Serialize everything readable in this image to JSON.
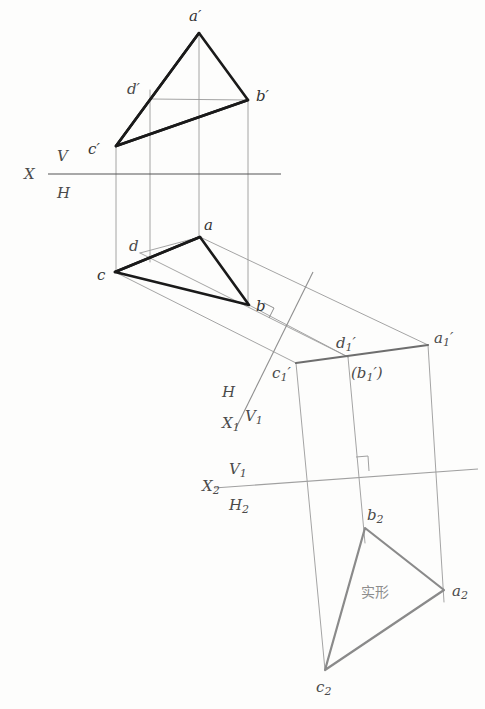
{
  "figure": {
    "background_color": "#fdfdfc",
    "heavy_line_color": "#1a1a1a",
    "light_line_color": "#9a9a9a",
    "true_shape_line_color": "#8a8a8a",
    "label_color": "#4a4a4a"
  },
  "axes": {
    "x_main": {
      "name": "X",
      "upper_label": "V",
      "lower_label": "H",
      "x1": 48,
      "y1": 174,
      "x2": 281,
      "y2": 174
    },
    "x1_aux": {
      "name": "X",
      "subscript": "1",
      "upper_label": "H",
      "lower_label": "V",
      "lower_subscript": "1",
      "x1": 313,
      "y1": 272,
      "x2": 236,
      "y2": 428
    },
    "x2_aux": {
      "name": "X",
      "subscript": "2",
      "upper_label": "V",
      "upper_subscript": "1",
      "lower_label": "H",
      "lower_subscript": "2",
      "x1": 214,
      "y1": 488,
      "x2": 478,
      "y2": 469
    }
  },
  "views": {
    "frontal_v": {
      "name": "V projection (front view)",
      "points": [
        {
          "id": "a_prime",
          "label": "a",
          "prime": "′",
          "x": 199,
          "y": 33,
          "lx": 196,
          "ly": 16
        },
        {
          "id": "b_prime",
          "label": "b",
          "prime": "′",
          "x": 248,
          "y": 100,
          "lx": 258,
          "ly": 97
        },
        {
          "id": "c_prime",
          "label": "c",
          "prime": "′",
          "x": 116,
          "y": 146,
          "lx": 95,
          "ly": 150
        },
        {
          "id": "d_prime",
          "label": "d",
          "prime": "′",
          "x": 150,
          "y": 99,
          "lx": 133,
          "ly": 90
        }
      ]
    },
    "horizontal_h": {
      "name": "H projection (top view)",
      "points": [
        {
          "id": "a",
          "label": "a",
          "prime": "",
          "x": 200,
          "y": 237,
          "lx": 205,
          "ly": 226
        },
        {
          "id": "b",
          "label": "b",
          "prime": "",
          "x": 249,
          "y": 305,
          "lx": 257,
          "ly": 304
        },
        {
          "id": "c",
          "label": "c",
          "prime": "",
          "x": 115,
          "y": 272,
          "lx": 101,
          "ly": 275
        },
        {
          "id": "d",
          "label": "d",
          "prime": "",
          "x": 140,
          "y": 253,
          "lx": 133,
          "ly": 247
        }
      ]
    },
    "aux_v1": {
      "name": "V1 auxiliary projection (edge view of plane)",
      "points": [
        {
          "id": "a1_prime",
          "label": "a",
          "sub": "1",
          "prime": "′",
          "x": 428,
          "y": 345,
          "lx": 437,
          "ly": 340
        },
        {
          "id": "d1_prime",
          "label": "d",
          "sub": "1",
          "prime": "′",
          "x": 348,
          "y": 357,
          "lx": 340,
          "ly": 344
        },
        {
          "id": "b1_prime",
          "label": "(b",
          "sub": "1",
          "prime": "′)",
          "x": 348,
          "y": 357,
          "lx": 357,
          "ly": 372
        },
        {
          "id": "c1_prime",
          "label": "c",
          "sub": "1",
          "prime": "′",
          "x": 296,
          "y": 363,
          "lx": 277,
          "ly": 373
        }
      ]
    },
    "aux_h2": {
      "name": "H2 auxiliary projection (true shape)",
      "annotation": "实形",
      "annotation_x": 362,
      "annotation_y": 595,
      "points": [
        {
          "id": "a2",
          "label": "a",
          "sub": "2",
          "prime": "",
          "x": 444,
          "y": 590,
          "lx": 454,
          "ly": 592
        },
        {
          "id": "b2",
          "label": "b",
          "sub": "2",
          "prime": "",
          "x": 365,
          "y": 528,
          "lx": 370,
          "ly": 515
        },
        {
          "id": "c2",
          "label": "c",
          "sub": "2",
          "prime": "",
          "x": 325,
          "y": 670,
          "lx": 320,
          "ly": 686
        }
      ]
    }
  },
  "right_angle_marks": [
    {
      "id": "mark-x1",
      "x": 269,
      "y": 309,
      "note": "perpendicular to X1 axis"
    },
    {
      "id": "mark-x2",
      "x": 363,
      "y": 470,
      "note": "perpendicular to X2 axis"
    }
  ]
}
